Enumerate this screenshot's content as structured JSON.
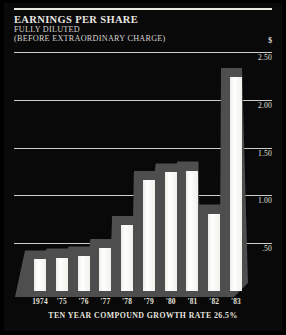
{
  "header": {
    "title": "EARNINGS PER SHARE",
    "subtitle1": "FULLY DILUTED",
    "subtitle2": "(BEFORE EXTRAORDINARY CHARGE)"
  },
  "footnote": "TEN YEAR COMPOUND GROWTH RATE 26.5%",
  "currency_symbol": "$",
  "colors": {
    "background": "#090909",
    "bar": "#ffffff",
    "shadow": "#4e4e4e",
    "gridline": "#cfcdc7",
    "text": "#e6e4de"
  },
  "chart_data": {
    "type": "bar",
    "title": "EARNINGS PER SHARE",
    "subtitle": "FULLY DILUTED (BEFORE EXTRAORDINARY CHARGE)",
    "xlabel": "TEN YEAR COMPOUND GROWTH RATE 26.5%",
    "ylabel": "$",
    "ylim": [
      0,
      2.5
    ],
    "yticks": [
      0.5,
      1.0,
      1.5,
      2.0,
      2.5
    ],
    "ytick_labels": [
      ".50",
      "1.00",
      "1.50",
      "2.00",
      "2.50"
    ],
    "grid": true,
    "legend": "none",
    "categories": [
      "1974",
      "'75",
      "'76",
      "'77",
      "'78",
      "'79",
      "'80",
      "'81",
      "'82",
      "'83"
    ],
    "values": [
      0.33,
      0.35,
      0.37,
      0.45,
      0.69,
      1.16,
      1.24,
      1.26,
      0.81,
      2.24
    ]
  }
}
